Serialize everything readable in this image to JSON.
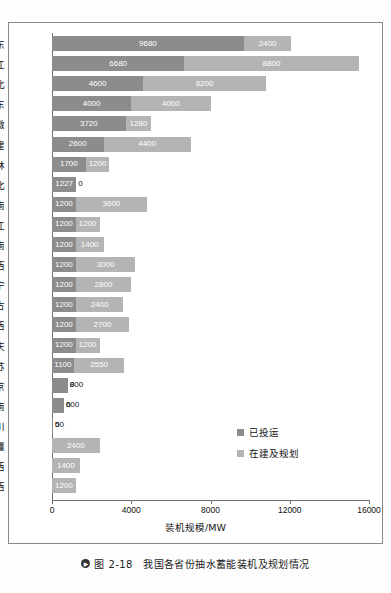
{
  "caption": {
    "marker": "▶",
    "text": "图 2-18　我国各省份抽水蓄能装机及规划情况"
  },
  "legend": {
    "position": "inside-bottom-right",
    "items": [
      {
        "label": "已投运",
        "color": "#8c8c8c"
      },
      {
        "label": "在建及规划",
        "color": "#b4b4b4"
      }
    ]
  },
  "chart_data": {
    "type": "bar",
    "orientation": "horizontal",
    "stacked": true,
    "title": "",
    "xlabel": "装机规模/MW",
    "ylabel": "",
    "xlim": [
      0,
      16000
    ],
    "xticks": [
      0,
      4000,
      8000,
      12000,
      16000
    ],
    "xtick_labels": [
      "0",
      "4000",
      "8000",
      "12000",
      "16000"
    ],
    "grid": false,
    "categories": [
      "广东",
      "浙江",
      "河北",
      "山东",
      "安徽",
      "福建",
      "吉林",
      "湖北",
      "河南",
      "黑龙江",
      "湖南",
      "江西",
      "辽宁",
      "内蒙古",
      "山西",
      "重庆",
      "江苏",
      "北京",
      "海南",
      "四川",
      "新疆",
      "陕西",
      "广西"
    ],
    "series": [
      {
        "name": "已投运",
        "color": "#8c8c8c",
        "values": [
          9680,
          6680,
          4600,
          4000,
          3720,
          2600,
          1700,
          1227,
          1200,
          1200,
          1200,
          1200,
          1200,
          1200,
          1200,
          1200,
          1100,
          800,
          600,
          50,
          0,
          0,
          0
        ]
      },
      {
        "name": "在建及规划",
        "color": "#b4b4b4",
        "values": [
          2400,
          8800,
          6200,
          4000,
          1280,
          4400,
          1200,
          0,
          3600,
          1200,
          1400,
          3000,
          2800,
          2400,
          2700,
          1200,
          2550,
          0,
          0,
          0,
          2400,
          1400,
          1200
        ]
      }
    ]
  }
}
